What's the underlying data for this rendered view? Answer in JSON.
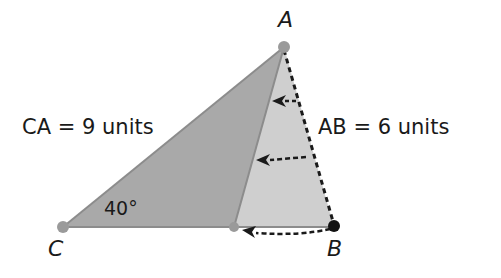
{
  "diagram": {
    "type": "geometry-triangle",
    "vertices": {
      "A": {
        "label": "A",
        "x": 284,
        "y": 47
      },
      "B": {
        "label": "B",
        "x": 334,
        "y": 227
      },
      "C": {
        "label": "C",
        "x": 63,
        "y": 227
      },
      "B_prime": {
        "x": 234,
        "y": 227
      }
    },
    "labels": {
      "ca": "CA = 9 units",
      "ab": "AB = 6 units",
      "angle_c": "40°"
    },
    "colors": {
      "dark_fill": "#a9a9a9",
      "light_fill": "#cfcfcf",
      "point_gray": "#9a9a9a",
      "point_b": "#111111",
      "dashed": "#1a1a1a"
    }
  }
}
